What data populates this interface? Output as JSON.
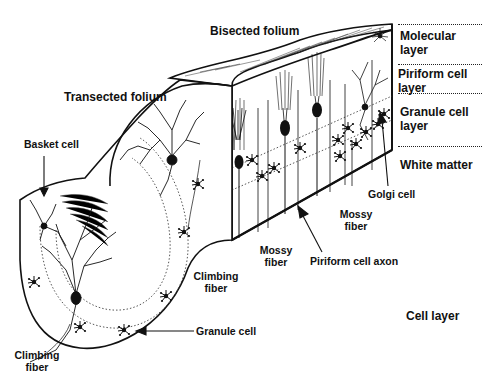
{
  "diagram": {
    "structure_labels": {
      "bisected_folium": "Bisected folium",
      "transected_folium": "Transected folium"
    },
    "layer_legend": [
      {
        "id": "molecular",
        "line1": "Molecular",
        "line2": "layer"
      },
      {
        "id": "piriform",
        "line1": "Piriform cell",
        "line2": "layer"
      },
      {
        "id": "granule",
        "line1": "Granule cell",
        "line2": "layer"
      },
      {
        "id": "white",
        "line1": "White matter",
        "line2": ""
      }
    ],
    "cell_labels": {
      "basket_cell": "Basket cell",
      "climbing_fiber_mid_1": "Climbing",
      "climbing_fiber_mid_2": "fiber",
      "climbing_fiber_low_1": "Climbing",
      "climbing_fiber_low_2": "fiber",
      "mossy_fiber_left_1": "Mossy",
      "mossy_fiber_left_2": "fiber",
      "mossy_fiber_right_1": "Mossy",
      "mossy_fiber_right_2": "fiber",
      "piriform_cell_axon": "Piriform cell axon",
      "golgi_cell": "Golgi cell",
      "granule_cell": "Granule cell",
      "cell_layer": "Cell layer"
    },
    "colors": {
      "ink": "#111111",
      "background": "#ffffff"
    }
  }
}
